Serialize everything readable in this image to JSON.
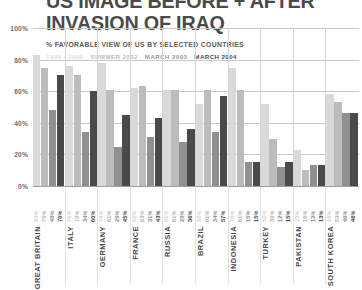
{
  "title": {
    "line1": "US IMAGE BEFORE + AFTER",
    "line2": "INVASION OF IRAQ"
  },
  "subtitle": "% FAVORABLE VIEW OF US BY SELECTED COUNTRIES",
  "chart_data": {
    "type": "bar",
    "title": "US IMAGE BEFORE + AFTER INVASION OF IRAQ",
    "subtitle": "% FAVORABLE VIEW OF US BY SELECTED COUNTRIES",
    "xlabel": "",
    "ylabel": "",
    "ylim": [
      0,
      100
    ],
    "yticks": [
      "0%",
      "20%",
      "40%",
      "60%",
      "80%",
      "100%"
    ],
    "ytick_values": [
      0,
      20,
      40,
      60,
      80,
      100
    ],
    "grid": true,
    "legend_position": "top",
    "legend": [
      "1999 - 2000",
      "SUMMER 2002",
      "MARCH 2003",
      "MARCH 2004"
    ],
    "series": [
      {
        "name": "1999 - 2000",
        "color": "#d9d9d9"
      },
      {
        "name": "SUMMER 2002",
        "color": "#bcbcbc"
      },
      {
        "name": "MARCH 2003",
        "color": "#909090"
      },
      {
        "name": "MARCH 2004",
        "color": "#4a4a4a"
      }
    ],
    "categories": [
      "GREAT BRITAIN",
      "ITALY",
      "GERMANY",
      "FRANCE",
      "RUSSIA",
      "BRAZIL",
      "INDONESIA",
      "TURKEY",
      "PAKISTAN",
      "SOUTH KOREA"
    ],
    "groups": [
      {
        "country": "GREAT BRITAIN",
        "values": [
          83,
          75,
          48,
          70
        ],
        "labels": [
          "83%",
          "75%",
          "48%",
          "70%"
        ]
      },
      {
        "country": "ITALY",
        "values": [
          76,
          70,
          34,
          60
        ],
        "labels": [
          "76%",
          "70%",
          "34%",
          "60%"
        ]
      },
      {
        "country": "GERMANY",
        "values": [
          78,
          61,
          25,
          45
        ],
        "labels": [
          "78%",
          "61%",
          "25%",
          "45%"
        ]
      },
      {
        "country": "FRANCE",
        "values": [
          62,
          63,
          31,
          43
        ],
        "labels": [
          "62%",
          "63%",
          "31%",
          "43%"
        ]
      },
      {
        "country": "RUSSIA",
        "values": [
          61,
          61,
          28,
          36
        ],
        "labels": [
          "61%",
          "61%",
          "28%",
          "36%"
        ]
      },
      {
        "country": "BRAZIL",
        "values": [
          52,
          61,
          34,
          57
        ],
        "labels": [
          "52%",
          "61%",
          "34%",
          "57%"
        ]
      },
      {
        "country": "INDONESIA",
        "values": [
          75,
          61,
          15,
          15
        ],
        "labels": [
          "75%",
          "61%",
          "15%",
          "15%"
        ]
      },
      {
        "country": "TURKEY",
        "values": [
          52,
          30,
          12,
          15
        ],
        "labels": [
          "52%",
          "30%",
          "12%",
          "15%"
        ]
      },
      {
        "country": "PAKISTAN",
        "values": [
          23,
          10,
          13,
          13
        ],
        "labels": [
          "23%",
          "10%",
          "13%",
          "13%"
        ]
      },
      {
        "country": "SOUTH KOREA",
        "values": [
          58,
          53,
          46,
          46
        ],
        "labels": [
          "58%",
          "53%",
          "46%",
          "46%"
        ]
      }
    ]
  }
}
